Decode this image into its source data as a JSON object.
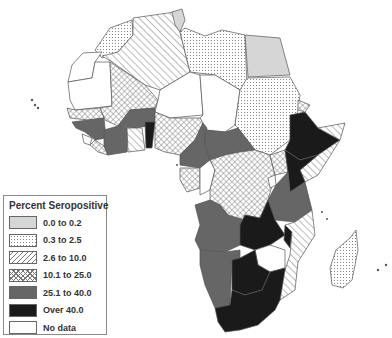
{
  "legend": {
    "title": "Percent Seropositive",
    "items": [
      {
        "label": "0.0 to 0.2",
        "pattern": "fill-c0"
      },
      {
        "label": "0.3 to 2.5",
        "pattern": "fill-c1"
      },
      {
        "label": "2.6 to 10.0",
        "pattern": "fill-c2"
      },
      {
        "label": "10.1 to 25.0",
        "pattern": "fill-c3"
      },
      {
        "label": "25.1 to 40.0",
        "pattern": "fill-c4"
      },
      {
        "label": "Over 40.0",
        "pattern": "fill-c5"
      },
      {
        "label": "No data",
        "pattern": "fill-c6"
      }
    ]
  },
  "colors": {
    "cat_0_0_to_0_2": "#d6d6d6",
    "cat_0_3_to_2_5": "dotted light gray",
    "cat_2_6_to_10_0": "diagonal hatch",
    "cat_10_1_to_25_0": "cross hatch",
    "cat_25_1_to_40_0": "#666666",
    "cat_over_40_0": "#1a1a1a",
    "cat_no_data": "#ffffff"
  }
}
